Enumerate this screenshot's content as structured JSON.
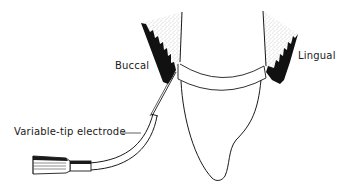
{
  "diagram": {
    "labels": {
      "buccal": "Buccal",
      "lingual": "Lingual",
      "electrode": "Variable-tip electrode"
    },
    "colors": {
      "ink": "#1a1a1a",
      "background": "#ffffff",
      "stipple": "#8a8a8a"
    }
  }
}
